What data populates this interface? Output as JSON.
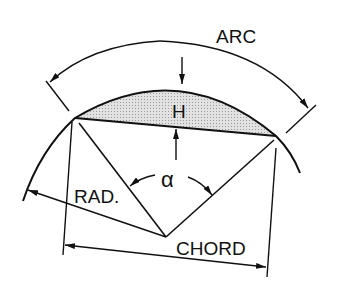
{
  "diagram": {
    "labels": {
      "arc": "ARC",
      "height": "H",
      "radius": "RAD.",
      "angle": "α",
      "chord": "CHORD"
    },
    "colors": {
      "line": "#111111",
      "segment_fill": "#d4d4d4",
      "background": "#ffffff"
    }
  }
}
